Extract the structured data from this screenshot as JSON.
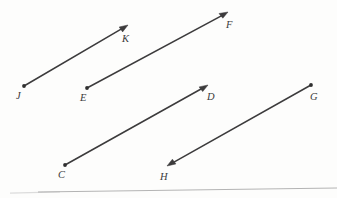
{
  "figure": {
    "kind": "geometry-diagram",
    "background_color": "#fdfdfc",
    "stroke_color": "#3c3b3c",
    "label_color": "#3a3a3a",
    "width": 337,
    "height": 198
  },
  "rays": [
    {
      "id": "ray-jk",
      "name": "ray-j-k",
      "tail_label": "J",
      "head_label": "K",
      "tail": {
        "x": 24,
        "y": 86
      },
      "head": {
        "x": 128,
        "y": 25
      },
      "tail_marker": "dot",
      "head_marker": "arrow"
    },
    {
      "id": "ray-ef",
      "name": "ray-e-f",
      "tail_label": "E",
      "head_label": "F",
      "tail": {
        "x": 87,
        "y": 88
      },
      "head": {
        "x": 228,
        "y": 12
      },
      "tail_marker": "dot",
      "head_marker": "arrow"
    },
    {
      "id": "ray-cd",
      "name": "ray-c-d",
      "tail_label": "C",
      "head_label": "D",
      "tail": {
        "x": 65,
        "y": 165
      },
      "head": {
        "x": 208,
        "y": 85
      },
      "tail_marker": "dot",
      "head_marker": "arrow"
    },
    {
      "id": "ray-gh",
      "name": "ray-g-h",
      "tail_label": "G",
      "head_label": "H",
      "tail": {
        "x": 311,
        "y": 85
      },
      "head": {
        "x": 167,
        "y": 166
      },
      "tail_marker": "dot",
      "head_marker": "arrow"
    }
  ],
  "labels": [
    {
      "text": "K",
      "x": 122,
      "y": 34,
      "for": "ray-jk-head"
    },
    {
      "text": "F",
      "x": 226,
      "y": 20,
      "for": "ray-ef-head"
    },
    {
      "text": "J",
      "x": 16,
      "y": 91,
      "for": "ray-jk-tail"
    },
    {
      "text": "E",
      "x": 80,
      "y": 93,
      "for": "ray-ef-tail"
    },
    {
      "text": "D",
      "x": 207,
      "y": 92,
      "for": "ray-cd-head"
    },
    {
      "text": "G",
      "x": 310,
      "y": 92,
      "for": "ray-gh-tail"
    },
    {
      "text": "C",
      "x": 58,
      "y": 170,
      "for": "ray-cd-tail"
    },
    {
      "text": "H",
      "x": 160,
      "y": 172,
      "for": "ray-gh-head"
    }
  ],
  "page_edge": {
    "name": "page-edge-line",
    "left": {
      "x": 38,
      "y": 192
    },
    "right": {
      "x": 337,
      "y": 188
    },
    "color": "#b4b4b4"
  }
}
